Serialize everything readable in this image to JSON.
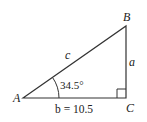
{
  "diagram": {
    "type": "right-triangle",
    "vertices": {
      "A": {
        "label": "A",
        "x": 23,
        "y": 98
      },
      "B": {
        "label": "B",
        "x": 126,
        "y": 26
      },
      "C": {
        "label": "C",
        "x": 126,
        "y": 98
      }
    },
    "sides": {
      "c": {
        "label": "c"
      },
      "a": {
        "label": "a"
      },
      "b": {
        "label": "b = 10.5"
      }
    },
    "angle_A": {
      "label": "34.5°"
    },
    "right_angle_at": "C",
    "colors": {
      "stroke": "#333333",
      "text": "#222222"
    }
  }
}
